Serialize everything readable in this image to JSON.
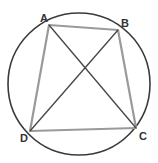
{
  "diagram": {
    "type": "cyclic-quadrilateral",
    "colors": {
      "circle": "#3a3a3a",
      "sides": "#9a9a9a",
      "diagonals": "#444444",
      "labels": "#333333",
      "background": "#ffffff"
    },
    "circle": {
      "cx": 79,
      "cy": 84,
      "r": 71
    },
    "points": {
      "A": {
        "label": "A",
        "x": 49,
        "y": 25,
        "lx": 40,
        "ly": 22
      },
      "B": {
        "label": "B",
        "x": 118,
        "y": 30,
        "lx": 121,
        "ly": 27
      },
      "C": {
        "label": "C",
        "x": 136,
        "y": 128,
        "lx": 139,
        "ly": 140
      },
      "D": {
        "label": "D",
        "x": 30,
        "y": 131,
        "lx": 20,
        "ly": 142
      }
    },
    "sides": [
      "AB",
      "BC",
      "CD",
      "DA"
    ],
    "diagonals": [
      "AC",
      "BD"
    ]
  }
}
